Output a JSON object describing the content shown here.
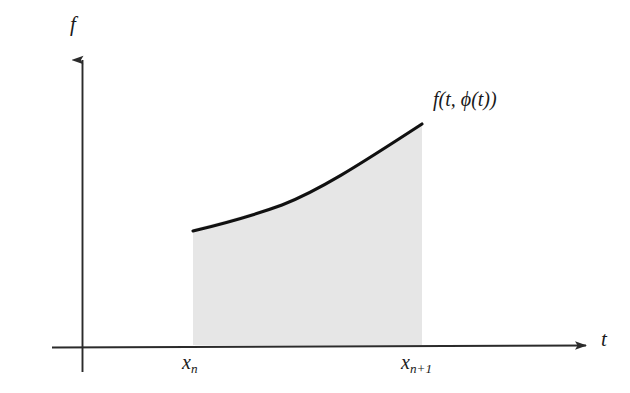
{
  "figure": {
    "name": "numerical-integration-step-diagram",
    "background_color": "#ffffff",
    "axes": {
      "vertical": {
        "label": "f",
        "origin": {
          "x": 82,
          "y": 347
        },
        "tip": {
          "x": 82,
          "y": 48
        },
        "color": "#2b2b2b"
      },
      "horizontal": {
        "label": "t",
        "origin": {
          "x": 52,
          "y": 347
        },
        "tip": {
          "x": 592,
          "y": 345
        },
        "color": "#2b2b2b"
      }
    },
    "curve": {
      "label": "f(t, ϕ(t))",
      "label_parts": {
        "function": "f",
        "open_paren": "(",
        "variable": "t",
        "comma": ", ",
        "phi": "ϕ",
        "phi_arg": "(t)",
        "close_paren": ")"
      },
      "color": "#111111",
      "stroke_width": 3,
      "start_point": {
        "x": 193,
        "y": 231
      },
      "end_point": {
        "x": 422,
        "y": 124
      },
      "control_points": [
        {
          "x": 250,
          "y": 218
        },
        {
          "x": 310,
          "y": 195
        },
        {
          "x": 370,
          "y": 162
        }
      ]
    },
    "shaded_region": {
      "name": "integral-area",
      "fill_color": "#e6e6e6",
      "left_boundary_x": 193,
      "right_boundary_x": 422,
      "baseline_y": 345
    },
    "tick_labels": [
      {
        "text": "x",
        "subscript": "n",
        "x": 200,
        "y": 365
      },
      {
        "text": "x",
        "subscript": "n+1",
        "x": 430,
        "y": 365
      }
    ]
  }
}
